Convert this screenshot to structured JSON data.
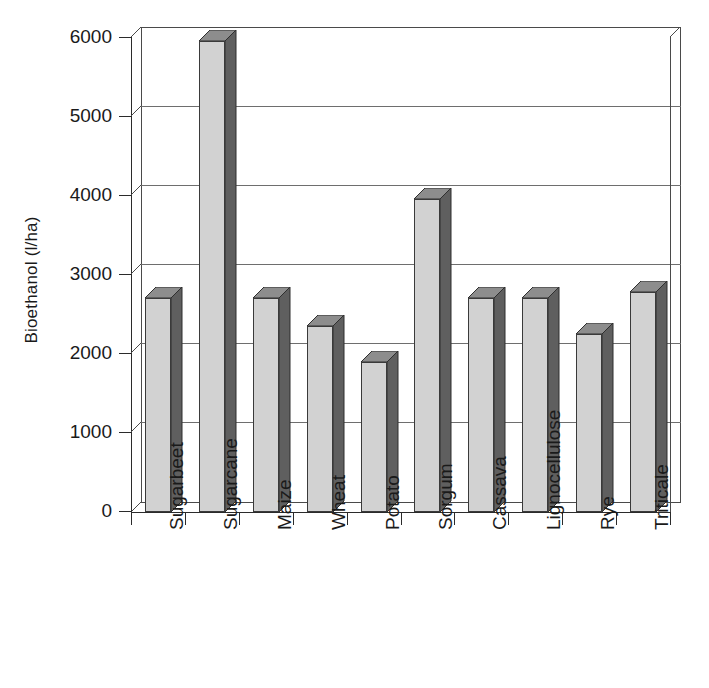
{
  "chart_data": {
    "type": "bar",
    "title": "",
    "subtitle": "",
    "xlabel": "",
    "ylabel": "Bioethanol (l/ha)",
    "categories": [
      "Sugarbeet",
      "Sugarcane",
      "Maize",
      "Wheat",
      "Potato",
      "Sorgum",
      "Cassava",
      "Lignocellulose",
      "Rye",
      "Triticale"
    ],
    "values": [
      2700,
      5950,
      2700,
      2350,
      1900,
      3950,
      2700,
      2700,
      2250,
      2780
    ],
    "series": [
      {
        "name": "Bioethanol yield",
        "values": [
          2700,
          5950,
          2700,
          2350,
          1900,
          3950,
          2700,
          2700,
          2250,
          2780
        ]
      }
    ],
    "ylim": [
      0,
      6000
    ],
    "ytick_labels": [
      "0",
      "1000",
      "2000",
      "3000",
      "4000",
      "5000",
      "6000"
    ],
    "ytick_values": [
      0,
      1000,
      2000,
      3000,
      4000,
      5000,
      6000
    ],
    "grid": "horizontal",
    "legend": "none",
    "style": "3d-column",
    "colors": {
      "bar_front": "#d2d2d2",
      "bar_side": "#5f5f5f",
      "bar_top": "#8d8d8d",
      "axis": "#2b2b2b",
      "grid": "#4a4a4a",
      "text": "#1a1a1a",
      "background": "#ffffff"
    }
  }
}
